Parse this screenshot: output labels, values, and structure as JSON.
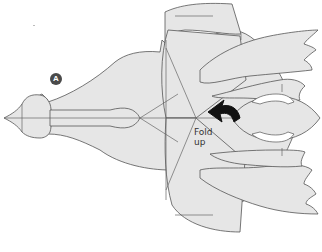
{
  "diagram": {
    "type": "origami-fold-diagram",
    "step_marker": "A",
    "instruction": {
      "line1": "Fold",
      "line2": "up"
    },
    "arrow": "curved-fold-arrow",
    "colors": {
      "paper_fill": "#e6e6e6",
      "outline": "#555555",
      "arrow": "#111111",
      "badge": "#4a4a4a",
      "background": "#ffffff"
    }
  }
}
